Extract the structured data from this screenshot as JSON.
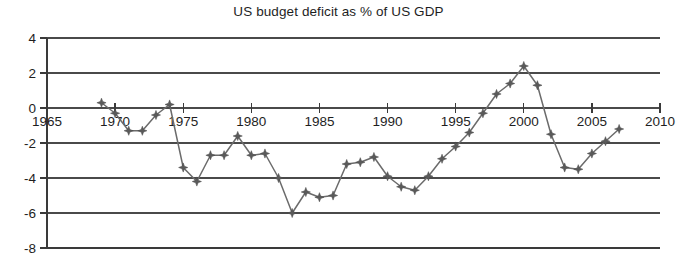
{
  "chart_data": {
    "type": "line",
    "title": "US budget deficit as % of US GDP",
    "xlabel": "",
    "ylabel": "",
    "xlim": [
      1965,
      2010
    ],
    "ylim": [
      -8,
      4
    ],
    "grid": true,
    "legend": false,
    "legend_position": "none",
    "y_ticks": [
      4,
      2,
      0,
      -2,
      -4,
      -6,
      -8
    ],
    "y_tick_labels": [
      "4",
      "2",
      "0",
      "-2",
      "-4",
      "-6",
      "-8"
    ],
    "x_ticks": [
      1965,
      1970,
      1975,
      1980,
      1985,
      1990,
      1995,
      2000,
      2005,
      2010
    ],
    "x_tick_labels": [
      "1965",
      "1970",
      "1975",
      "1980",
      "1985",
      "1990",
      "1995",
      "2000",
      "2005",
      "2010"
    ],
    "marker": "4-pointed-star",
    "line_color": "#6b6b6b",
    "marker_color": "#5a5a5a",
    "series": [
      {
        "name": "US budget deficit as % of US GDP",
        "x": [
          1969,
          1970,
          1971,
          1972,
          1973,
          1974,
          1975,
          1976,
          1977,
          1978,
          1979,
          1980,
          1981,
          1982,
          1983,
          1984,
          1985,
          1986,
          1987,
          1988,
          1989,
          1990,
          1991,
          1992,
          1993,
          1994,
          1995,
          1996,
          1997,
          1998,
          1999,
          2000,
          2001,
          2002,
          2003,
          2004,
          2005,
          2006,
          2007
        ],
        "values": [
          0.3,
          -0.3,
          -1.3,
          -1.3,
          -0.4,
          0.2,
          -3.4,
          -4.2,
          -2.7,
          -2.7,
          -1.6,
          -2.7,
          -2.6,
          -4.0,
          -6.0,
          -4.8,
          -5.1,
          -5.0,
          -3.2,
          -3.1,
          -2.8,
          -3.9,
          -4.5,
          -4.7,
          -3.9,
          -2.9,
          -2.2,
          -1.4,
          -0.3,
          0.8,
          1.4,
          2.4,
          1.3,
          -1.5,
          -3.4,
          -3.5,
          -2.6,
          -1.9,
          -1.2
        ]
      }
    ]
  }
}
